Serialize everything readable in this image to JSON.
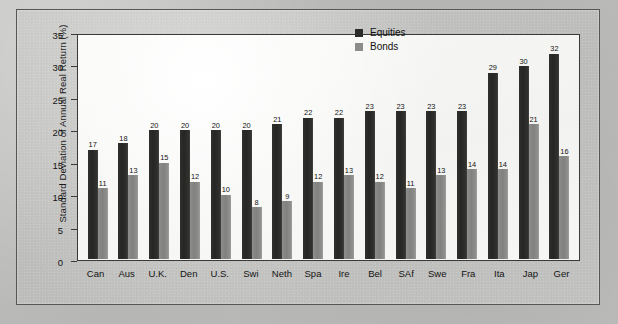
{
  "chart_data": {
    "type": "bar",
    "title": "",
    "xlabel": "",
    "ylabel": "Standard Deviation of Annual Real Return (%)",
    "ylim": [
      0,
      35
    ],
    "yticks": [
      0,
      5,
      10,
      15,
      20,
      25,
      30,
      35
    ],
    "grid": false,
    "legend_position": "top-right",
    "categories": [
      "Can",
      "Aus",
      "U.K.",
      "Den",
      "U.S.",
      "Swi",
      "Neth",
      "Spa",
      "Ire",
      "Bel",
      "SAf",
      "Swe",
      "Fra",
      "Ita",
      "Jap",
      "Ger"
    ],
    "series": [
      {
        "name": "Equities",
        "color": "#2b2b29",
        "values": [
          17,
          18,
          20,
          20,
          20,
          20,
          21,
          22,
          22,
          23,
          23,
          23,
          23,
          29,
          30,
          32
        ]
      },
      {
        "name": "Bonds",
        "color": "#8c8c8a",
        "values": [
          11,
          13,
          15,
          12,
          10,
          8,
          9,
          12,
          13,
          12,
          11,
          13,
          14,
          14,
          21,
          16
        ]
      }
    ]
  },
  "legend": {
    "items": [
      {
        "label": "Equities"
      },
      {
        "label": "Bonds"
      }
    ]
  },
  "colors": {
    "equities": "#2b2b29",
    "bonds": "#8c8c8a",
    "plot_background": "#f5f5f3",
    "page_background": "#bdbdbb",
    "axis": "#3a3a38"
  }
}
